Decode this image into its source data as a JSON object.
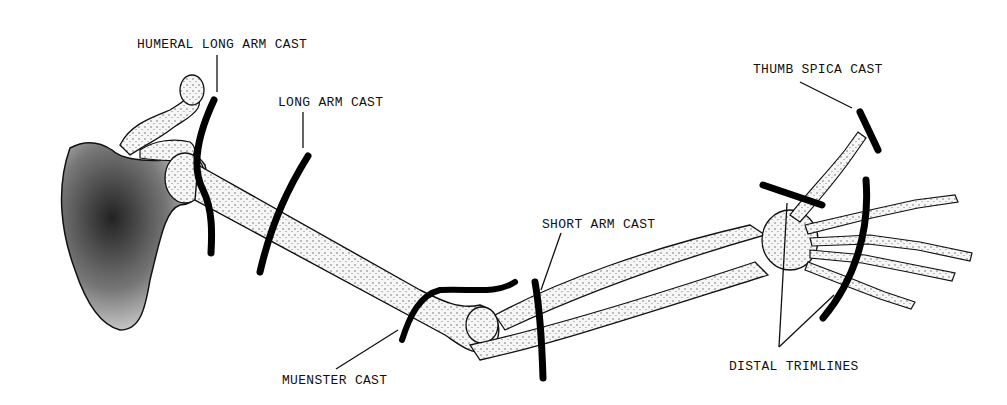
{
  "diagram": {
    "labels": [
      {
        "id": "humeral",
        "text": "HUMERAL LONG ARM CAST",
        "x": 137,
        "y": 37
      },
      {
        "id": "long_arm",
        "text": "LONG ARM CAST",
        "x": 278,
        "y": 95
      },
      {
        "id": "thumb_spica",
        "text": "THUMB SPICA CAST",
        "x": 753,
        "y": 62
      },
      {
        "id": "short_arm",
        "text": "SHORT ARM CAST",
        "x": 542,
        "y": 217
      },
      {
        "id": "muenster",
        "text": "MUENSTER CAST",
        "x": 282,
        "y": 373
      },
      {
        "id": "distal_trimlines",
        "text": "DISTAL TRIMLINES",
        "x": 729,
        "y": 359
      }
    ],
    "colors": {
      "background": "#ffffff",
      "ink": "#111111",
      "bone_fill": "#f4f4f4",
      "scapula_shade": "#555555"
    }
  }
}
